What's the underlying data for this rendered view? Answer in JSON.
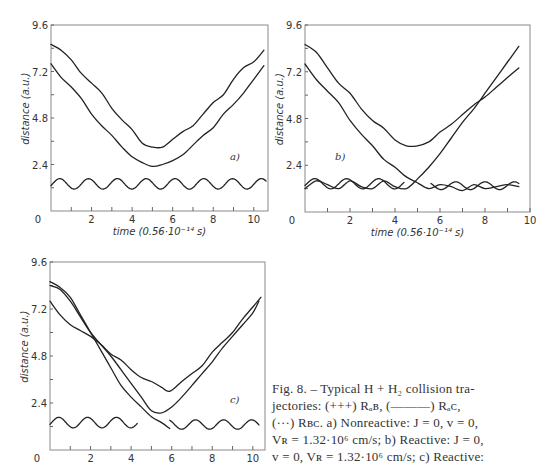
{
  "caption": {
    "lines": [
      "Fig. 8. – Typical H + H₂ collision tra-",
      "jectories: (+++) Rₐʙ,  (———) Rₐᴄ,",
      "(···) Rʙᴄ. a) Nonreactive: J = 0,  v = 0,",
      "Vʀ = 1.32·10⁶ cm/s;  b) Reactive: J = 0,",
      "v = 0,  Vʀ = 1.32·10⁶ cm/s;  c) Reactive:"
    ]
  },
  "chart_data": [
    {
      "type": "line",
      "panel": "a)",
      "title": "",
      "xlabel": "time (0.56·10⁻¹⁴ s)",
      "ylabel": "distance (a.u.)",
      "xlim": [
        0,
        10.7
      ],
      "ylim": [
        0,
        9.6
      ],
      "xticks": [
        "0",
        "2",
        "4",
        "6",
        "8",
        "10"
      ],
      "yticks": [
        "0",
        "2.4",
        "4.8",
        "7.2",
        "9.6"
      ],
      "grid": false,
      "frame": {
        "left": 51,
        "top": 25,
        "right": 268,
        "bottom": 211
      },
      "label_pos": [
        230,
        160
      ],
      "show_xlabel": true,
      "series": [
        {
          "name": "upper",
          "x": [
            0,
            0.5,
            1,
            1.5,
            2,
            2.5,
            3,
            3.5,
            4,
            4.5,
            5,
            5.5,
            6,
            6.5,
            7,
            7.5,
            8,
            8.5,
            9,
            9.5,
            10,
            10.5
          ],
          "y": [
            8.6,
            8.3,
            7.8,
            7.1,
            6.6,
            6.1,
            5.3,
            4.7,
            4.2,
            3.5,
            3.3,
            3.3,
            3.7,
            4.1,
            4.4,
            5.0,
            5.6,
            6.0,
            6.8,
            7.4,
            7.7,
            8.3
          ]
        },
        {
          "name": "lower",
          "x": [
            0,
            0.5,
            1,
            1.5,
            2,
            2.5,
            3,
            3.5,
            4,
            4.5,
            5,
            5.5,
            6,
            6.5,
            7,
            7.5,
            8,
            8.5,
            9,
            9.5,
            10,
            10.5
          ],
          "y": [
            7.6,
            6.9,
            6.4,
            5.8,
            5.0,
            4.4,
            3.9,
            3.3,
            2.8,
            2.5,
            2.3,
            2.4,
            2.6,
            2.9,
            3.4,
            3.9,
            4.3,
            5.0,
            5.5,
            6.1,
            6.8,
            7.5
          ]
        },
        {
          "name": "vibration",
          "osc": {
            "x0": 0,
            "x1": 10.6,
            "mean": 1.4,
            "amp": 0.27,
            "period": 1.42,
            "phase": -0.35
          }
        }
      ]
    },
    {
      "type": "line",
      "panel": "b)",
      "title": "",
      "xlabel": "time (0.56·10⁻¹⁴ s)",
      "ylabel": "distance (a.u.)",
      "xlim": [
        0,
        10
      ],
      "ylim": [
        0,
        9.6
      ],
      "xticks": [
        "0",
        "2",
        "4",
        "6",
        "8",
        "10"
      ],
      "yticks": [
        "0",
        "2.4",
        "4.8",
        "7.2",
        "9.6"
      ],
      "grid": false,
      "frame": {
        "left": 305,
        "top": 25,
        "right": 530,
        "bottom": 212
      },
      "label_pos": [
        335,
        160
      ],
      "show_xlabel": true,
      "series": [
        {
          "name": "upper",
          "x": [
            0,
            0.5,
            1,
            1.5,
            2,
            2.5,
            3,
            3.5,
            4,
            4.5,
            5,
            5.5,
            6,
            6.5,
            7,
            7.5,
            8,
            8.5,
            9,
            9.5
          ],
          "y": [
            8.6,
            8.2,
            7.4,
            6.6,
            6.1,
            5.3,
            4.7,
            4.3,
            3.7,
            3.4,
            3.4,
            3.6,
            4.1,
            4.5,
            5.0,
            5.5,
            5.9,
            6.4,
            6.9,
            7.4
          ]
        },
        {
          "name": "lower",
          "x": [
            0,
            0.5,
            1,
            1.5,
            2,
            2.5,
            3,
            3.5,
            4,
            4.5,
            5,
            5.5,
            6,
            6.5,
            7,
            7.5,
            8,
            8.5,
            9,
            9.5
          ],
          "y": [
            7.6,
            6.8,
            6.2,
            5.6,
            4.7,
            4.0,
            3.4,
            2.7,
            2.3,
            1.8,
            1.5,
            1.2,
            1.4,
            1.3,
            1.1,
            1.4,
            1.2,
            1.3,
            1.4,
            1.3
          ]
        },
        {
          "name": "reactive",
          "x": [
            0,
            0.5,
            1,
            1.5,
            2,
            2.5,
            3,
            3.5,
            4,
            4.5,
            5,
            5.5,
            6,
            6.5,
            7,
            7.5,
            8,
            8.5,
            9,
            9.5
          ],
          "y": [
            1.2,
            1.6,
            1.4,
            1.2,
            1.6,
            1.3,
            1.2,
            1.6,
            1.3,
            1.2,
            1.7,
            2.3,
            3.0,
            3.8,
            4.6,
            5.3,
            6.1,
            6.9,
            7.7,
            8.5
          ]
        },
        {
          "name": "vibration",
          "osc": {
            "x0": 0,
            "x1": 4.4,
            "mean": 1.45,
            "amp": 0.26,
            "period": 1.42,
            "phase": -0.35
          }
        },
        {
          "name": "vibration2",
          "osc": {
            "x0": 5.6,
            "x1": 9.5,
            "mean": 1.35,
            "amp": 0.2,
            "period": 1.3,
            "phase": 0.6
          }
        }
      ]
    },
    {
      "type": "line",
      "panel": "c)",
      "title": "",
      "xlabel": "",
      "ylabel": "distance (a.u.)",
      "xlim": [
        0,
        10.6
      ],
      "ylim": [
        0,
        9.6
      ],
      "xticks": [
        "0",
        "2",
        "4",
        "6",
        "8",
        "10"
      ],
      "yticks": [
        "0",
        "2.4",
        "4.8",
        "7.2",
        "9.6"
      ],
      "grid": false,
      "frame": {
        "left": 50,
        "top": 262,
        "right": 265,
        "bottom": 450
      },
      "label_pos": [
        230,
        403
      ],
      "show_xlabel": false,
      "series": [
        {
          "name": "steep",
          "x": [
            0,
            0.5,
            1,
            1.5,
            2,
            2.5,
            3,
            3.5,
            4,
            4.5,
            5,
            5.5,
            5.9
          ],
          "y": [
            8.6,
            8.3,
            7.8,
            6.9,
            6.0,
            5.1,
            4.2,
            3.3,
            2.7,
            2.2,
            1.7,
            1.4,
            1.1
          ]
        },
        {
          "name": "upper",
          "x": [
            0,
            0.5,
            1,
            1.5,
            2,
            2.5,
            3,
            3.5,
            4,
            4.5,
            5,
            5.5,
            5.9,
            6.5,
            7,
            7.5,
            8,
            8.5,
            9,
            9.5,
            10,
            10.4
          ],
          "y": [
            7.6,
            6.9,
            6.4,
            6.1,
            5.8,
            5.4,
            4.9,
            4.6,
            4.1,
            3.7,
            3.5,
            3.2,
            3.0,
            3.5,
            3.9,
            4.3,
            5.0,
            5.5,
            6.0,
            6.7,
            7.3,
            7.8
          ]
        },
        {
          "name": "lower",
          "x": [
            0,
            0.5,
            1,
            1.5,
            2,
            2.5,
            3,
            3.5,
            4,
            4.5,
            5,
            5.5,
            6,
            6.5,
            7,
            7.5,
            8,
            8.5,
            9,
            9.5,
            10,
            10.3
          ],
          "y": [
            8.4,
            8.2,
            7.6,
            6.8,
            6.0,
            5.4,
            4.8,
            4.1,
            3.4,
            2.7,
            2.0,
            1.9,
            2.2,
            2.7,
            3.3,
            3.9,
            4.5,
            5.2,
            5.8,
            6.4,
            7.0,
            7.6
          ]
        },
        {
          "name": "vibration",
          "osc": {
            "x0": 0,
            "x1": 4.3,
            "mean": 1.4,
            "amp": 0.27,
            "period": 1.42,
            "phase": -0.35
          }
        },
        {
          "name": "vibration2",
          "osc": {
            "x0": 5.9,
            "x1": 10.3,
            "mean": 1.3,
            "amp": 0.24,
            "period": 1.38,
            "phase": 0.3
          }
        }
      ]
    }
  ]
}
